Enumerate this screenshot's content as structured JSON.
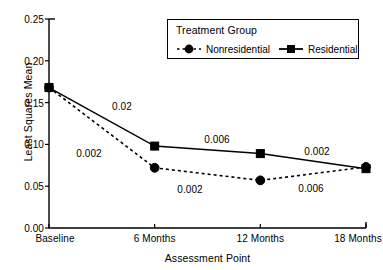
{
  "chart_data": {
    "type": "line",
    "title": "",
    "xlabel": "Assessment Point",
    "ylabel": "Least Squares Mean",
    "categories": [
      "Baseline",
      "6 Months",
      "12 Months",
      "18 Months"
    ],
    "ylim": [
      0.0,
      0.25
    ],
    "yticks": [
      "0.25",
      "0.20",
      "0.15",
      "0.10",
      "0.05",
      "0.00"
    ],
    "ytick_values": [
      0.25,
      0.2,
      0.15,
      0.1,
      0.05,
      0.0
    ],
    "grid": false,
    "legend_position": "top-right-inside",
    "legend_title": "Treatment Group",
    "series": [
      {
        "name": "Nonresidential",
        "values": [
          0.168,
          0.072,
          0.057,
          0.073
        ],
        "line_style": "dashed",
        "marker": "circle",
        "color": "#000000"
      },
      {
        "name": "Residential",
        "values": [
          0.168,
          0.098,
          0.089,
          0.071
        ],
        "line_style": "solid",
        "marker": "square",
        "color": "#000000"
      }
    ],
    "annotations": [
      {
        "text": "0.02",
        "x_px": 122,
        "y_px": 106
      },
      {
        "text": "0.002",
        "x_px": 89,
        "y_px": 153
      },
      {
        "text": "0.006",
        "x_px": 217,
        "y_px": 139
      },
      {
        "text": "0.002",
        "x_px": 190,
        "y_px": 189
      },
      {
        "text": "0.002",
        "x_px": 317,
        "y_px": 151
      },
      {
        "text": "0.006",
        "x_px": 311,
        "y_px": 188
      }
    ]
  }
}
